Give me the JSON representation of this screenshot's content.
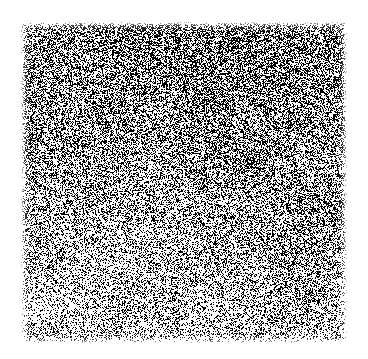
{
  "canvas": {
    "width": 368,
    "height": 359,
    "background_color": "#ffffff"
  },
  "plate": {
    "label": "dithered-noise-field",
    "x": 20,
    "y": 21,
    "width": 328,
    "height": 323,
    "ink_color": "#000000",
    "paper_color": "#ffffff",
    "rendering": "1-bit random dither (black and white pixels only)",
    "pixel_size": 1
  },
  "chart_data": {
    "type": "heatmap",
    "title": "",
    "subtitle": "",
    "xlabel": "",
    "ylabel": "",
    "grid": false,
    "legend": "none",
    "axis_ticks": [],
    "tick_labels": [],
    "annotations": [],
    "value_unit": "ink coverage fraction (0 = white paper, 1 = solid black)",
    "x": [
      0,
      0.25,
      0.5,
      0.75,
      1
    ],
    "y": [
      0,
      0.25,
      0.5,
      0.75,
      1
    ],
    "zlim": [
      0,
      1
    ],
    "values": [
      [
        0.46,
        0.5,
        0.53,
        0.54,
        0.52
      ],
      [
        0.42,
        0.45,
        0.48,
        0.5,
        0.48
      ],
      [
        0.36,
        0.38,
        0.41,
        0.43,
        0.42
      ],
      [
        0.3,
        0.32,
        0.34,
        0.36,
        0.36
      ],
      [
        0.25,
        0.27,
        0.29,
        0.31,
        0.31
      ]
    ],
    "sample_regions": [
      {
        "name": "top-left",
        "x": 25,
        "y": 25,
        "width": 40,
        "height": 40,
        "coverage": 0.47
      },
      {
        "name": "top-right",
        "x": 250,
        "y": 40,
        "width": 40,
        "height": 40,
        "coverage": 0.52
      },
      {
        "name": "center",
        "x": 165,
        "y": 165,
        "width": 40,
        "height": 40,
        "coverage": 0.4
      },
      {
        "name": "bottom-left",
        "x": 40,
        "y": 290,
        "width": 40,
        "height": 40,
        "coverage": 0.28
      },
      {
        "name": "bottom-right",
        "x": 300,
        "y": 295,
        "width": 40,
        "height": 40,
        "coverage": 0.33
      }
    ],
    "gradient": {
      "direction": "top-to-bottom",
      "top_coverage": 0.52,
      "bottom_coverage": 0.27,
      "horizontal_bias": "slightly denser toward the right edge",
      "mottling_amplitude": 0.06,
      "mottling_scale_px": 46
    }
  },
  "accessibility": {
    "alt_text": "A square field of fine black-and-white dithered noise on white paper, denser and darker along the top and fading to lighter speckle toward the bottom."
  }
}
